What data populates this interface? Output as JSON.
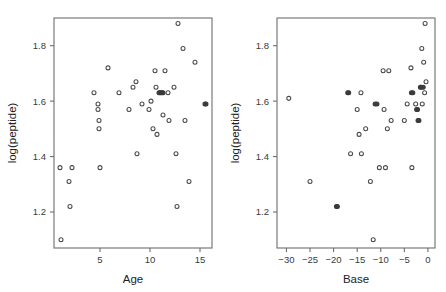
{
  "figure": {
    "background": "#ffffff",
    "point_color": "#4a4a4a",
    "axis_color": "#6e6e6e",
    "panel_count": 2
  },
  "chart_data": [
    {
      "type": "scatter",
      "title": "",
      "xlabel": "Age",
      "ylabel": "log(peptide)",
      "xlim": [
        0.4,
        16.2
      ],
      "ylim": [
        1.07,
        1.9
      ],
      "xticks": [
        5,
        10,
        15
      ],
      "xtick_labels": [
        "5",
        "10",
        "15"
      ],
      "yticks": [
        1.2,
        1.4,
        1.6,
        1.8
      ],
      "ytick_labels": [
        "1.2",
        "1.4",
        "1.6",
        "1.8"
      ],
      "grid": false,
      "legend": "none",
      "marker": "open-circle",
      "points": [
        {
          "x": 1.0,
          "y": 1.36
        },
        {
          "x": 1.1,
          "y": 1.1
        },
        {
          "x": 1.9,
          "y": 1.31
        },
        {
          "x": 2.0,
          "y": 1.22
        },
        {
          "x": 2.2,
          "y": 1.36
        },
        {
          "x": 4.4,
          "y": 1.63
        },
        {
          "x": 4.8,
          "y": 1.59
        },
        {
          "x": 4.8,
          "y": 1.57
        },
        {
          "x": 4.9,
          "y": 1.53
        },
        {
          "x": 4.9,
          "y": 1.5
        },
        {
          "x": 5.0,
          "y": 1.36
        },
        {
          "x": 5.8,
          "y": 1.72
        },
        {
          "x": 6.9,
          "y": 1.63
        },
        {
          "x": 7.9,
          "y": 1.57
        },
        {
          "x": 8.3,
          "y": 1.65
        },
        {
          "x": 8.6,
          "y": 1.67
        },
        {
          "x": 8.7,
          "y": 1.41
        },
        {
          "x": 9.2,
          "y": 1.59
        },
        {
          "x": 9.9,
          "y": 1.57
        },
        {
          "x": 10.1,
          "y": 1.6
        },
        {
          "x": 10.3,
          "y": 1.5
        },
        {
          "x": 10.5,
          "y": 1.71
        },
        {
          "x": 10.6,
          "y": 1.65
        },
        {
          "x": 10.7,
          "y": 1.48
        },
        {
          "x": 10.9,
          "y": 1.63
        },
        {
          "x": 11.0,
          "y": 1.63
        },
        {
          "x": 11.1,
          "y": 1.63
        },
        {
          "x": 11.2,
          "y": 1.63
        },
        {
          "x": 11.3,
          "y": 1.63
        },
        {
          "x": 11.3,
          "y": 1.55
        },
        {
          "x": 11.5,
          "y": 1.71
        },
        {
          "x": 11.8,
          "y": 1.63
        },
        {
          "x": 11.9,
          "y": 1.53
        },
        {
          "x": 12.4,
          "y": 1.65
        },
        {
          "x": 12.6,
          "y": 1.41
        },
        {
          "x": 12.7,
          "y": 1.22
        },
        {
          "x": 12.8,
          "y": 1.88
        },
        {
          "x": 13.3,
          "y": 1.79
        },
        {
          "x": 13.5,
          "y": 1.53
        },
        {
          "x": 13.9,
          "y": 1.31
        },
        {
          "x": 14.5,
          "y": 1.74
        },
        {
          "x": 15.5,
          "y": 1.59
        },
        {
          "x": 15.6,
          "y": 1.59
        }
      ]
    },
    {
      "type": "scatter",
      "title": "",
      "xlabel": "Base",
      "ylabel": "log(peptide)",
      "xlim": [
        -32.0,
        1.5
      ],
      "ylim": [
        1.07,
        1.9
      ],
      "xticks": [
        -30,
        -25,
        -20,
        -15,
        -10,
        -5,
        0
      ],
      "xtick_labels": [
        "−30",
        "−25",
        "−20",
        "−15",
        "−10",
        "−5",
        "0"
      ],
      "yticks": [
        1.2,
        1.4,
        1.6,
        1.8
      ],
      "ytick_labels": [
        "1.2",
        "1.4",
        "1.6",
        "1.8"
      ],
      "grid": false,
      "legend": "none",
      "marker": "open-circle",
      "points": [
        {
          "x": -29.5,
          "y": 1.61
        },
        {
          "x": -25.0,
          "y": 1.31
        },
        {
          "x": -19.4,
          "y": 1.22
        },
        {
          "x": -19.2,
          "y": 1.22
        },
        {
          "x": -17.0,
          "y": 1.63
        },
        {
          "x": -16.8,
          "y": 1.63
        },
        {
          "x": -16.4,
          "y": 1.41
        },
        {
          "x": -15.0,
          "y": 1.57
        },
        {
          "x": -14.6,
          "y": 1.48
        },
        {
          "x": -14.2,
          "y": 1.63
        },
        {
          "x": -14.1,
          "y": 1.41
        },
        {
          "x": -13.2,
          "y": 1.5
        },
        {
          "x": -12.2,
          "y": 1.31
        },
        {
          "x": -11.6,
          "y": 1.1
        },
        {
          "x": -11.2,
          "y": 1.59
        },
        {
          "x": -10.8,
          "y": 1.59
        },
        {
          "x": -10.3,
          "y": 1.36
        },
        {
          "x": -9.5,
          "y": 1.71
        },
        {
          "x": -9.3,
          "y": 1.57
        },
        {
          "x": -9.0,
          "y": 1.36
        },
        {
          "x": -8.6,
          "y": 1.5
        },
        {
          "x": -8.3,
          "y": 1.71
        },
        {
          "x": -7.8,
          "y": 1.53
        },
        {
          "x": -5.0,
          "y": 1.53
        },
        {
          "x": -4.4,
          "y": 1.59
        },
        {
          "x": -3.6,
          "y": 1.72
        },
        {
          "x": -3.5,
          "y": 1.63
        },
        {
          "x": -3.4,
          "y": 1.36
        },
        {
          "x": -3.2,
          "y": 1.63
        },
        {
          "x": -2.6,
          "y": 1.59
        },
        {
          "x": -2.4,
          "y": 1.57
        },
        {
          "x": -2.2,
          "y": 1.57
        },
        {
          "x": -2.1,
          "y": 1.53
        },
        {
          "x": -1.9,
          "y": 1.53
        },
        {
          "x": -1.6,
          "y": 1.65
        },
        {
          "x": -1.4,
          "y": 1.65
        },
        {
          "x": -1.3,
          "y": 1.79
        },
        {
          "x": -1.2,
          "y": 1.59
        },
        {
          "x": -1.0,
          "y": 1.65
        },
        {
          "x": -0.9,
          "y": 1.74
        },
        {
          "x": -0.7,
          "y": 1.63
        },
        {
          "x": -0.6,
          "y": 1.88
        },
        {
          "x": -0.4,
          "y": 1.67
        }
      ]
    }
  ]
}
